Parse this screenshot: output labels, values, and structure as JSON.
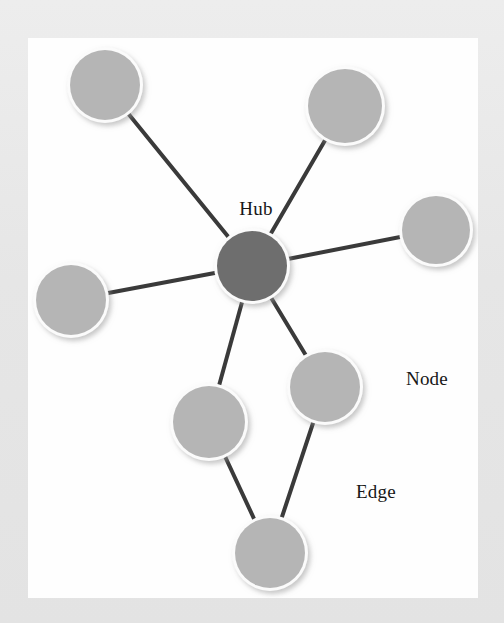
{
  "figure": {
    "kind": "network-diagram",
    "canvas": {
      "width": 504,
      "height": 623
    },
    "plot_area": {
      "x": 28,
      "y": 38,
      "width": 450,
      "height": 560
    },
    "colors": {
      "page_border": "#e9e9e9",
      "plot_background": "#fefefe",
      "node_fill": "#b5b5b5",
      "node_rim": "#fbfbfb",
      "node_shadow": "#c9c9c9",
      "hub_fill": "#6e6e6e",
      "edge_stroke": "#3a3a3a",
      "label_text": "#171717"
    },
    "edge_width_px": 4
  },
  "chart_data": {
    "type": "diagram",
    "xlabel": "",
    "ylabel": "",
    "nodes": [
      {
        "id": "hub",
        "label": "Hub",
        "role": "hub",
        "x": 224,
        "y": 228,
        "r": 35,
        "fill": "#6e6e6e"
      },
      {
        "id": "n1",
        "label": "",
        "role": "node",
        "x": 77,
        "y": 47,
        "r": 35,
        "fill": "#b5b5b5"
      },
      {
        "id": "n2",
        "label": "",
        "role": "node",
        "x": 317,
        "y": 68,
        "r": 37,
        "fill": "#b5b5b5"
      },
      {
        "id": "n3",
        "label": "",
        "role": "node",
        "x": 408,
        "y": 192,
        "r": 34,
        "fill": "#b5b5b5"
      },
      {
        "id": "n4",
        "label": "",
        "role": "node",
        "x": 43,
        "y": 262,
        "r": 35,
        "fill": "#b5b5b5"
      },
      {
        "id": "n5",
        "label": "",
        "role": "node",
        "x": 181,
        "y": 384,
        "r": 36,
        "fill": "#b5b5b5"
      },
      {
        "id": "n6",
        "label": "Node",
        "role": "node",
        "x": 297,
        "y": 349,
        "r": 35,
        "fill": "#b5b5b5"
      },
      {
        "id": "n7",
        "label": "",
        "role": "node",
        "x": 242,
        "y": 515,
        "r": 35,
        "fill": "#b5b5b5"
      }
    ],
    "edges": [
      {
        "id": "e1",
        "source": "hub",
        "target": "n1",
        "label": ""
      },
      {
        "id": "e2",
        "source": "hub",
        "target": "n2",
        "label": ""
      },
      {
        "id": "e3",
        "source": "hub",
        "target": "n3",
        "label": ""
      },
      {
        "id": "e4",
        "source": "hub",
        "target": "n4",
        "label": ""
      },
      {
        "id": "e5",
        "source": "hub",
        "target": "n5",
        "label": ""
      },
      {
        "id": "e6",
        "source": "hub",
        "target": "n6",
        "label": ""
      },
      {
        "id": "e7",
        "source": "n5",
        "target": "n7",
        "label": ""
      },
      {
        "id": "e8",
        "source": "n6",
        "target": "n7",
        "label": "Edge"
      }
    ],
    "annotations": [
      {
        "id": "label-hub",
        "text": "Hub",
        "x": 228,
        "y": 175,
        "font_size": 19,
        "anchor": "middle"
      },
      {
        "id": "label-node",
        "text": "Node",
        "x": 378,
        "y": 345,
        "font_size": 19,
        "anchor": "start"
      },
      {
        "id": "label-edge",
        "text": "Edge",
        "x": 328,
        "y": 458,
        "font_size": 19,
        "anchor": "start"
      }
    ],
    "legend_position": "none",
    "grid": false
  }
}
